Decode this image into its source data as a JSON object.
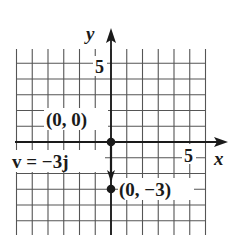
{
  "diagram": {
    "type": "coordinate-plane-vector",
    "colors": {
      "ink": "#1a1a1a",
      "grid": "#555555",
      "background": "#ffffff"
    },
    "axes": {
      "x_label": "x",
      "y_label": "y",
      "x_tick_label": "5",
      "y_tick_label": "5"
    },
    "grid": {
      "x_min": -6,
      "x_max": 6,
      "y_min": -6,
      "y_max": 6,
      "step": 1
    },
    "points": [
      {
        "label": "(0, 0)",
        "x": 0,
        "y": 0
      },
      {
        "label": "(0, −3)",
        "x": 0,
        "y": -3
      }
    ],
    "vector": {
      "label": "v = −3j",
      "from": [
        0,
        0
      ],
      "to": [
        0,
        -3
      ]
    }
  }
}
